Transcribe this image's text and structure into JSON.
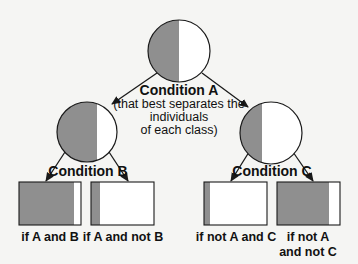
{
  "diagram": {
    "type": "decision-tree",
    "colors": {
      "gray_fill": "#8f8f8f",
      "white_fill": "#ffffff",
      "stroke": "#1a1a1a",
      "background": "#f5f5f3"
    },
    "root": {
      "title": "Condition A",
      "subtitle_lines": [
        "(that best separates the",
        "individuals",
        "of each class)"
      ],
      "gray_fraction": 0.5
    },
    "left_node": {
      "title": "Condition B",
      "gray_fraction": 0.67
    },
    "right_node": {
      "title": "Condition C",
      "gray_fraction": 0.36
    },
    "leaves": [
      {
        "label_lines": [
          "if A and B"
        ],
        "gray_fraction": 0.88
      },
      {
        "label_lines": [
          "if A and not B"
        ],
        "gray_fraction": 0.14
      },
      {
        "label_lines": [
          "if not A and C"
        ],
        "gray_fraction": 0.1
      },
      {
        "label_lines": [
          "if not A",
          "and not C"
        ],
        "gray_fraction": 0.83
      }
    ]
  }
}
